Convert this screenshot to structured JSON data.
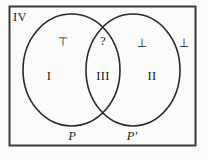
{
  "figure": {
    "type": "venn-diagram",
    "sets": 2,
    "background_color": "#fbfbfa",
    "stroke_color": "#2a2a2a"
  },
  "universe": {
    "region_label": "IV"
  },
  "circles": {
    "left": {
      "set_label": "P",
      "region_label": "I",
      "truth_symbol": "⊤"
    },
    "right": {
      "set_label": "P'",
      "region_label": "II",
      "truth_symbol": "⊥"
    },
    "intersection": {
      "region_label": "III",
      "truth_symbol": "?"
    },
    "outside": {
      "truth_symbol": "⊥"
    }
  }
}
